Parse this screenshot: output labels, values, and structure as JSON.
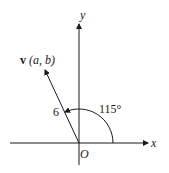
{
  "diagram": {
    "axes": {
      "x_label": "x",
      "y_label": "y",
      "origin_label": "O"
    },
    "vector": {
      "name": "v",
      "components": "(a, b)",
      "magnitude_label": "6",
      "angle_label": "115°",
      "angle_degrees": 115,
      "magnitude": 6
    },
    "colors": {
      "line": "#1a1a1a",
      "background": "#ffffff"
    }
  }
}
